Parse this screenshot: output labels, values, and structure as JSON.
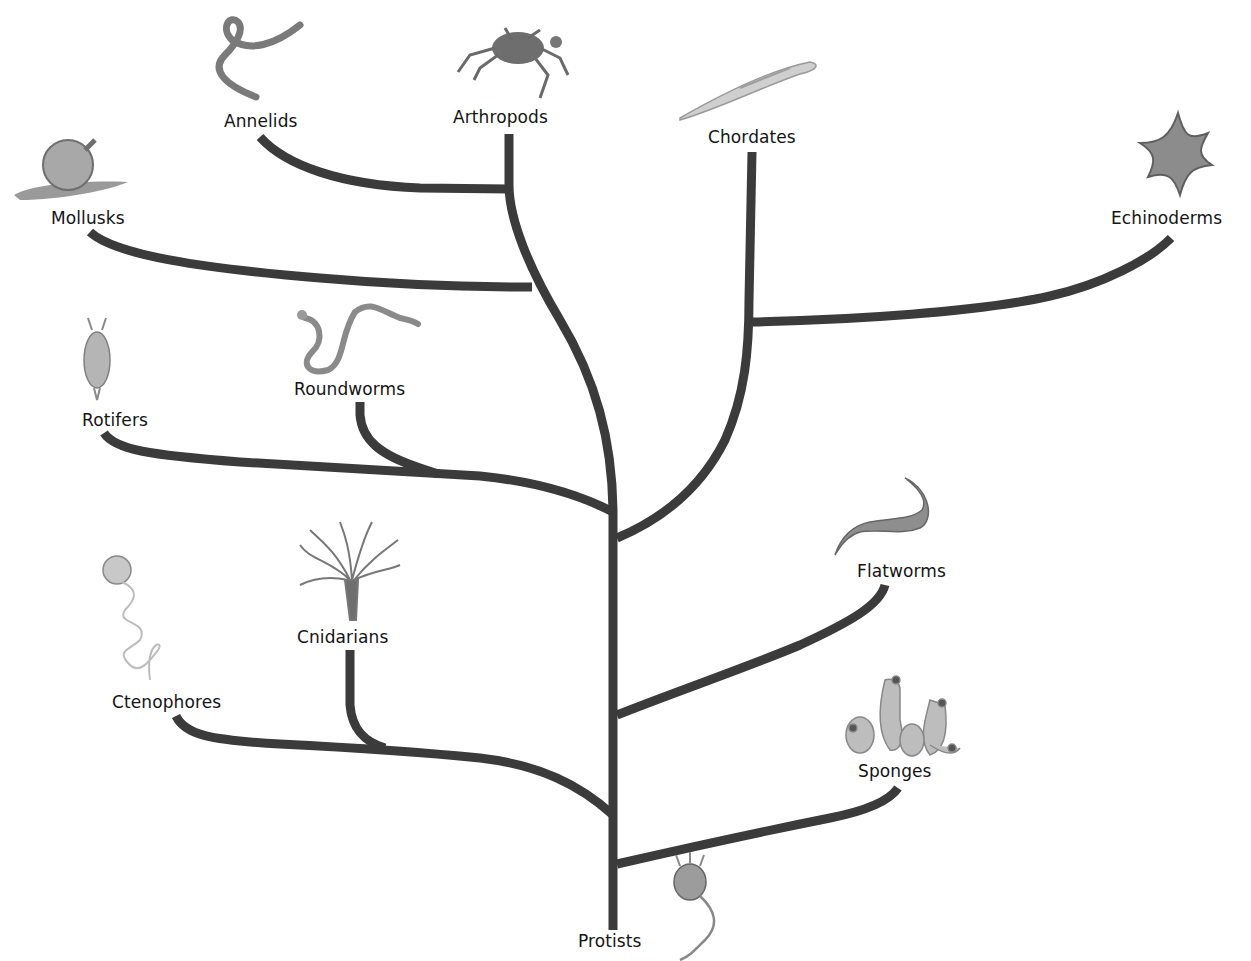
{
  "diagram": {
    "type": "phylogenetic-tree",
    "root": "Protists",
    "line_color": "#3b3b3b",
    "taxa": [
      {
        "id": "annelids",
        "label": "Annelids",
        "icon": "earthworm-icon",
        "x": 224,
        "y": 111
      },
      {
        "id": "arthropods",
        "label": "Arthropods",
        "icon": "crab-icon",
        "x": 453,
        "y": 107
      },
      {
        "id": "chordates",
        "label": "Chordates",
        "icon": "lancelet-icon",
        "x": 708,
        "y": 127
      },
      {
        "id": "echinoderms",
        "label": "Echinoderms",
        "icon": "starfish-icon",
        "x": 1111,
        "y": 208
      },
      {
        "id": "mollusks",
        "label": "Mollusks",
        "icon": "snail-icon",
        "x": 51,
        "y": 208
      },
      {
        "id": "rotifers",
        "label": "Rotifers",
        "icon": "rotifer-icon",
        "x": 82,
        "y": 410
      },
      {
        "id": "roundworms",
        "label": "Roundworms",
        "icon": "roundworm-icon",
        "x": 294,
        "y": 379
      },
      {
        "id": "flatworms",
        "label": "Flatworms",
        "icon": "flatworm-icon",
        "x": 857,
        "y": 561
      },
      {
        "id": "cnidarians",
        "label": "Cnidarians",
        "icon": "sea-anemone-icon",
        "x": 297,
        "y": 627
      },
      {
        "id": "ctenophores",
        "label": "Ctenophores",
        "icon": "comb-jelly-icon",
        "x": 112,
        "y": 692
      },
      {
        "id": "sponges",
        "label": "Sponges",
        "icon": "sponge-icon",
        "x": 858,
        "y": 761
      },
      {
        "id": "protists",
        "label": "Protists",
        "icon": "choanoflagellate-icon",
        "x": 578,
        "y": 931
      }
    ]
  }
}
